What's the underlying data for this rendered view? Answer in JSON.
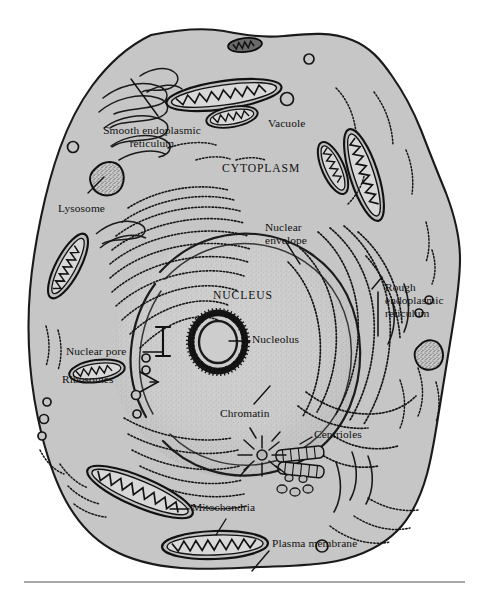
{
  "figure": {
    "caption_rule": true
  },
  "colors": {
    "cytoplasm_fill": "#c6c6c6",
    "cytoplasm_stroke": "#1a1a1a",
    "nucleus_fill": "#cfcfcf",
    "nucleus_stroke": "#2a2a2a",
    "organelle_fill": "#bdbdbd",
    "organelle_stroke": "#141414",
    "nucleolus_color": "#111111",
    "label_color": "#111111",
    "rule_color": "#8a8a8a",
    "page_background": "#ffffff"
  },
  "labels": [
    {
      "id": "smooth-er",
      "text_lines": [
        "Smooth endoplasmic",
        "reticulum"
      ],
      "x": 82,
      "y": 124,
      "align": "center",
      "style": "small"
    },
    {
      "id": "vacuole",
      "text_lines": [
        "Vacuole"
      ],
      "x": 268,
      "y": 118,
      "align": "left",
      "style": "small"
    },
    {
      "id": "cytoplasm",
      "text_lines": [
        "CYTOPLASM"
      ],
      "x": 222,
      "y": 163,
      "align": "left",
      "style": "caps"
    },
    {
      "id": "lysosome",
      "text_lines": [
        "Lysosome"
      ],
      "x": 58,
      "y": 203,
      "align": "left",
      "style": "small"
    },
    {
      "id": "nuclear-envelope",
      "text_lines": [
        "Nuclear",
        "envelope"
      ],
      "x": 265,
      "y": 221,
      "align": "left",
      "style": "small"
    },
    {
      "id": "rough-er",
      "text_lines": [
        "Rough",
        "endoplasmic",
        "reticulum"
      ],
      "x": 385,
      "y": 281,
      "align": "left",
      "style": "small"
    },
    {
      "id": "nucleus",
      "text_lines": [
        "NUCLEUS"
      ],
      "x": 213,
      "y": 290,
      "align": "left",
      "style": "caps"
    },
    {
      "id": "nucleolus",
      "text_lines": [
        "Nucleolus"
      ],
      "x": 252,
      "y": 338,
      "align": "left",
      "style": "small"
    },
    {
      "id": "nuclear-pore",
      "text_lines": [
        "Nuclear pore"
      ],
      "x": 68,
      "y": 354,
      "align": "left",
      "style": "small"
    },
    {
      "id": "ribosomes",
      "text_lines": [
        "Ribosomes"
      ],
      "x": 63,
      "y": 381,
      "align": "left",
      "style": "small"
    },
    {
      "id": "chromatin",
      "text_lines": [
        "Chromatin"
      ],
      "x": 222,
      "y": 411,
      "align": "left",
      "style": "small"
    },
    {
      "id": "centrioles",
      "text_lines": [
        "Centrioles"
      ],
      "x": 315,
      "y": 433,
      "align": "left",
      "style": "small"
    },
    {
      "id": "mitochondria",
      "text_lines": [
        "Mitochondria"
      ],
      "x": 192,
      "y": 511,
      "align": "left",
      "style": "small"
    },
    {
      "id": "plasma-membrane",
      "text_lines": [
        "Plasma membrane"
      ],
      "x": 272,
      "y": 543,
      "align": "left",
      "style": "small"
    }
  ],
  "structures": {
    "cell_outline": "Plasma membrane — irregular rounded polygon enclosing the cell",
    "nucleus": "Large stippled sphere, centre-left of cell",
    "nucleolus": "Dark stippled ring inside nucleus",
    "nuclear_envelope": "Double membrane around nucleus with a visible pore gap on the left",
    "smooth_er": "Tubular un-beaded membranes, upper left",
    "rough_er": "Stacked beaded (ribosome-studded) cisternae, right of nucleus",
    "mitochondria_count": 9,
    "lysosome_count": 2,
    "vacuole_count": 8,
    "centrioles": "Pair of short striated barrels plus radiating aster, lower right of nucleus"
  },
  "leaders": [
    {
      "id": "leader-smooth-er",
      "from": [
        158,
        116
      ],
      "to": [
        130,
        78
      ]
    },
    {
      "id": "leader-lysosome",
      "from": [
        88,
        193
      ],
      "to": [
        104,
        176
      ]
    },
    {
      "id": "leader-nuclear-envelope",
      "from": [
        285,
        240
      ],
      "to": [
        300,
        262
      ]
    },
    {
      "id": "leader-nucleolus",
      "from": [
        249,
        341
      ],
      "to": [
        228,
        341
      ]
    },
    {
      "id": "leader-nuclear-pore",
      "from": [
        143,
        352
      ],
      "to": [
        163,
        352
      ]
    },
    {
      "id": "leader-ribosomes",
      "from": [
        126,
        382
      ],
      "to": [
        140,
        382
      ]
    },
    {
      "id": "leader-chromatin",
      "from": [
        252,
        404
      ],
      "to": [
        268,
        387
      ]
    },
    {
      "id": "leader-mitochondria",
      "from": [
        188,
        509
      ],
      "to": [
        172,
        509
      ]
    },
    {
      "id": "leader-mitochondria-2",
      "from": [
        225,
        519
      ],
      "to": [
        215,
        536
      ]
    },
    {
      "id": "leader-plasma-membrane",
      "from": [
        268,
        551
      ],
      "to": [
        252,
        570
      ]
    },
    {
      "id": "leader-rough-er",
      "from": [
        382,
        277
      ],
      "to": [
        372,
        288
      ]
    }
  ]
}
